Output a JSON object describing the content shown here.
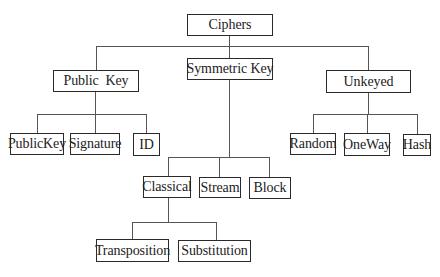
{
  "diagram": {
    "type": "tree",
    "root": {
      "label": "Ciphers",
      "children": [
        {
          "label": "Public Key",
          "children": [
            {
              "label": "PublicKey"
            },
            {
              "label": "Signature"
            },
            {
              "label": "ID"
            }
          ]
        },
        {
          "label": "Symmetric Key",
          "children": [
            {
              "label": "Classical",
              "children": [
                {
                  "label": "Transposition"
                },
                {
                  "label": "Substitution"
                }
              ]
            },
            {
              "label": "Stream"
            },
            {
              "label": "Block"
            }
          ]
        },
        {
          "label": "Unkeyed",
          "children": [
            {
              "label": "Random"
            },
            {
              "label": "OneWay"
            },
            {
              "label": "Hash"
            }
          ]
        }
      ]
    }
  },
  "nodes": {
    "ciphers": "Ciphers",
    "public_key": "Public  Key",
    "symmetric_key": "Symmetric Key",
    "unkeyed": "Unkeyed",
    "publickey": "PublicKey",
    "signature": "Signature",
    "id": "ID",
    "random": "Random",
    "oneway": "OneWay",
    "hash": "Hash",
    "classical": "Classical",
    "stream": "Stream",
    "block": "Block",
    "transposition": "Transposition",
    "substitution": "Substitution"
  }
}
